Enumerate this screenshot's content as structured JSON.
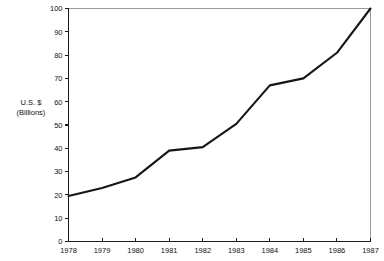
{
  "chart_data": {
    "type": "line",
    "title": "",
    "subtitle": "",
    "xlabel": "",
    "ylabel": "U.S. $\n(Billions)",
    "ylabel_line1": "U.S. $",
    "ylabel_line2": "(Billions)",
    "categories": [
      "1978",
      "1979",
      "1980",
      "1981",
      "1982",
      "1983",
      "1984",
      "1985",
      "1986",
      "1987"
    ],
    "x": [
      1978,
      1979,
      1980,
      1981,
      1982,
      1983,
      1984,
      1985,
      1986,
      1987
    ],
    "values": [
      19.5,
      23,
      27.5,
      39,
      40.5,
      50.5,
      67,
      70,
      81,
      100
    ],
    "series": [
      {
        "name": "U.S. $ (Billions)",
        "values": [
          19.5,
          23,
          27.5,
          39,
          40.5,
          50.5,
          67,
          70,
          81,
          100
        ],
        "color": "#161616"
      }
    ],
    "ylim": [
      0,
      100
    ],
    "xlim": [
      1978,
      1987
    ],
    "ytick_values": [
      0,
      10,
      20,
      30,
      40,
      50,
      60,
      70,
      80,
      90,
      100
    ],
    "ytick_labels": [
      "0",
      "10",
      "20",
      "30",
      "40",
      "50",
      "60",
      "70",
      "80",
      "90",
      "100"
    ],
    "xtick_labels": [
      "1978",
      "1979",
      "1980",
      "1981",
      "1982",
      "1983",
      "1984",
      "1985",
      "1986",
      "1987"
    ],
    "grid": false,
    "legend": null,
    "legend_position": "none",
    "annotations": [],
    "colors": {
      "background": "#ffffff",
      "line": "#161616",
      "axis": "#1b1b1b",
      "frame": "#9a9a9a",
      "text": "#111111"
    }
  }
}
